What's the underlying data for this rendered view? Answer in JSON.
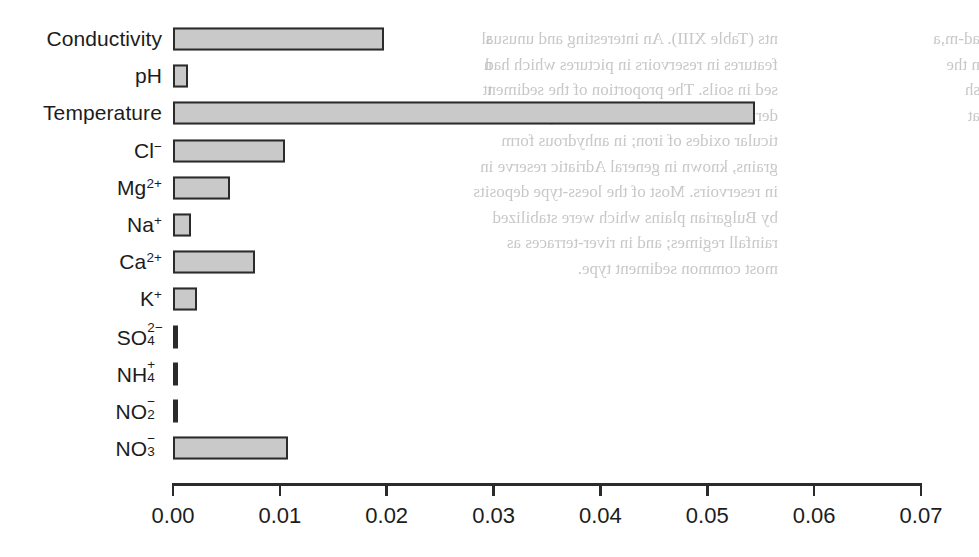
{
  "chart_data": {
    "type": "bar",
    "orientation": "horizontal",
    "title": "",
    "subtitle": "",
    "xlabel": "",
    "ylabel": "",
    "xlim": [
      0.0,
      0.07
    ],
    "xticks": [
      0.0,
      0.01,
      0.02,
      0.03,
      0.04,
      0.05,
      0.06,
      0.07
    ],
    "xticklabels": [
      "0.00",
      "0.01",
      "0.02",
      "0.03",
      "0.04",
      "0.05",
      "0.06",
      "0.07"
    ],
    "grid": false,
    "legend": null,
    "categories": [
      "Conductivity",
      "pH",
      "Temperature",
      "Cl-",
      "Mg2+",
      "Na+",
      "Ca2+",
      "K+",
      "SO42-",
      "NH4+",
      "NO2-",
      "NO3-"
    ],
    "values": [
      0.0197,
      0.0014,
      0.0545,
      0.0105,
      0.0053,
      0.0017,
      0.0077,
      0.0022,
      0.0004,
      0.0003,
      0.0003,
      0.0108
    ],
    "bars": [
      {
        "label_html": "Conductivity",
        "value": 0.0197,
        "style": "box"
      },
      {
        "label_html": "pH",
        "value": 0.0014,
        "style": "box"
      },
      {
        "label_html": "Temperature",
        "value": 0.0545,
        "style": "box"
      },
      {
        "label_html": "Cl<sup>−</sup>",
        "value": 0.0105,
        "style": "box"
      },
      {
        "label_html": "Mg<sup>2+</sup>",
        "value": 0.0053,
        "style": "box"
      },
      {
        "label_html": "Na<sup>+</sup>",
        "value": 0.0017,
        "style": "box"
      },
      {
        "label_html": "Ca<sup>2+</sup>",
        "value": 0.0077,
        "style": "box"
      },
      {
        "label_html": "K<sup>+</sup>",
        "value": 0.0022,
        "style": "box"
      },
      {
        "label_html": "SO<span class=\"stack\"><span class=\"up\">2−</span><span class=\"dn\">4</span></span>",
        "value": 0.0004,
        "style": "thin"
      },
      {
        "label_html": "NH<span class=\"stack\"><span class=\"up\">+</span><span class=\"dn\">4</span></span>",
        "value": 0.0003,
        "style": "thin"
      },
      {
        "label_html": "NO<span class=\"stack\"><span class=\"up\">−</span><span class=\"dn\">2</span></span>",
        "value": 0.0003,
        "style": "thin"
      },
      {
        "label_html": "NO<span class=\"stack\"><span class=\"up\">−</span><span class=\"dn\">3</span></span>",
        "value": 0.0108,
        "style": "box"
      }
    ],
    "colors": {
      "bar_fill": "#c9c9c9",
      "bar_edge": "#2b2b2b",
      "thin_bar": "#2b2b2b",
      "axis": "#2b2b2b",
      "text": "#1c1c1c",
      "background": "#ffffff"
    }
  },
  "background_bleed": {
    "note": "faint mirror-image show-through of text printed on the reverse side of the page",
    "left_fragment": "s\nn\nt\n",
    "right_column": "nts (Table XIII). An interesting and unusual\nfeatures in reservoirs in pictures which had\nsed in soils. The proportion of the sediment\nderived in the Danube basin in equal\nticular oxides of iron; in anhydrous form\ngrains, known in general Adriatic reserve in\nin reservoirs. Most of the loess-type deposits\nby Bulgarian plains which were stabilized\nrainfall regimes; and in river-terraces as\nmost common sediment type.",
    "far_right_column": "ad-m,a\nn the\nsh\nat\n"
  }
}
